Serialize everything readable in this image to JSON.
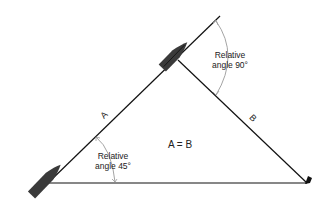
{
  "diagram": {
    "labels": {
      "side_a": "A",
      "side_b": "B",
      "equality": "A = B",
      "angle_top": {
        "line1": "Relative",
        "line2": "angle 90°"
      },
      "angle_bottom": {
        "line1": "Relative",
        "line2": "angle 45°"
      }
    },
    "colors": {
      "line": "#111111",
      "boat": "#3a3a3a",
      "arc": "#9a9a9a",
      "background": "#ffffff"
    },
    "points": {
      "start_boat": [
        48,
        183
      ],
      "later_boat": [
        178,
        60
      ],
      "heading_end": [
        220,
        16
      ],
      "landmark": [
        307,
        183
      ]
    }
  }
}
